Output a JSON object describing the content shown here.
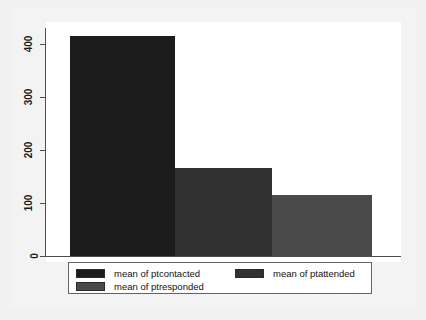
{
  "chart_data": {
    "type": "bar",
    "title": "",
    "subtitle": "",
    "xlabel": "",
    "ylabel": "",
    "categories": [
      "mean of ptcontacted",
      "mean of ptattended",
      "mean of ptresponded"
    ],
    "values": [
      415,
      166,
      115
    ],
    "ylim": [
      0,
      430
    ],
    "yticks": [
      0,
      100,
      200,
      300,
      400
    ],
    "ytick_labels": [
      "0",
      "100",
      "200",
      "300",
      "400"
    ],
    "xticks": [],
    "xtick_labels": [],
    "grid": false,
    "legend_position": "bottom",
    "series": [
      {
        "name": "mean of ptcontacted",
        "value": 415,
        "color": "#1c1c1c"
      },
      {
        "name": "mean of ptattended",
        "value": 166,
        "color": "#313131"
      },
      {
        "name": "mean of ptresponded",
        "value": 115,
        "color": "#4a4a4a"
      }
    ],
    "annotations": []
  },
  "axis": {
    "tick0": "0",
    "tick1": "100",
    "tick2": "200",
    "tick3": "300",
    "tick4": "400"
  },
  "legend": {
    "entry0": "mean of ptcontacted",
    "entry1": "mean of ptattended",
    "entry2": "mean of ptresponded"
  },
  "colors": {
    "bar1": "#1c1c1c",
    "bar2": "#313131",
    "bar3": "#4a4a4a",
    "axis": "#4d4d4d",
    "plot_background": "#ffffff",
    "page_background": "#f1f1f1",
    "legend_border": "#636363"
  }
}
